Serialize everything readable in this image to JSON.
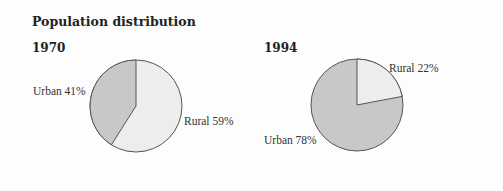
{
  "chart_data": [
    {
      "type": "pie",
      "title": "Population distribution",
      "subtitle": "1970",
      "categories": [
        "Urban",
        "Rural"
      ],
      "values": [
        41,
        59
      ],
      "labels": [
        "Urban 41%",
        "Rural 59%"
      ],
      "colors": {
        "Urban": "#c8c8c8",
        "Rural": "#ededed"
      }
    },
    {
      "type": "pie",
      "title": "Population distribution",
      "subtitle": "1994",
      "categories": [
        "Urban",
        "Rural"
      ],
      "values": [
        78,
        22
      ],
      "labels": [
        "Urban 78%",
        "Rural 22%"
      ],
      "colors": {
        "Urban": "#c8c8c8",
        "Rural": "#ededed"
      }
    }
  ],
  "page": {
    "title": "Population distribution",
    "charts": [
      {
        "year": "1970",
        "urban_label": "Urban 41%",
        "rural_label": "Rural 59%"
      },
      {
        "year": "1994",
        "urban_label": "Urban 78%",
        "rural_label": "Rural 22%"
      }
    ]
  }
}
